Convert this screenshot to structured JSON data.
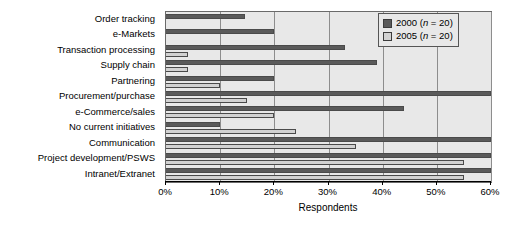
{
  "chart_data": {
    "type": "bar",
    "orientation": "horizontal",
    "title": "",
    "xlabel": "Respondents",
    "ylabel": "",
    "xlim": [
      0,
      60
    ],
    "xtick_labels": [
      "0%",
      "10%",
      "20%",
      "30%",
      "40%",
      "50%",
      "60%"
    ],
    "xtick_values": [
      0,
      10,
      20,
      30,
      40,
      50,
      60
    ],
    "grid": true,
    "legend_position": "top-right",
    "categories": [
      "Order tracking",
      "e-Markets",
      "Transaction processing",
      "Supply chain",
      "Partnering",
      "Procurement/purchase",
      "e-Commerce/sales",
      "No current initiatives",
      "Communication",
      "Project development/PSWS",
      "Intranet/Extranet"
    ],
    "series": [
      {
        "name": "2000",
        "legend_label": "2000 (n = 20)",
        "n": 20,
        "color": "#5a5a5a",
        "values": [
          14.5,
          20,
          33,
          39,
          20,
          60,
          44,
          10,
          60,
          60,
          60
        ]
      },
      {
        "name": "2005",
        "legend_label": "2005 (n = 20)",
        "n": 20,
        "color": "#d2d2d2",
        "values": [
          0,
          0,
          4,
          4,
          10,
          15,
          20,
          24,
          35,
          55,
          55
        ]
      }
    ]
  },
  "legend": {
    "entries": [
      {
        "year": "2000",
        "note": "(n = 20)"
      },
      {
        "year": "2005",
        "note": "(n = 20)"
      }
    ]
  }
}
